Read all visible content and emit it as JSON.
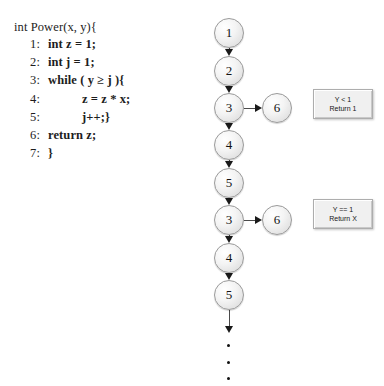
{
  "code": {
    "header": "int Power(x, y){",
    "lines": [
      {
        "num": "1:",
        "text": "int z = 1;",
        "indent": 1
      },
      {
        "num": "2:",
        "text": "int j = 1;",
        "indent": 1
      },
      {
        "num": "3:",
        "text": "while ( y ≥ j ){",
        "indent": 1
      },
      {
        "num": "4:",
        "text": "z = z * x;",
        "indent": 2
      },
      {
        "num": "5:",
        "text": "j++;}",
        "indent": 2
      },
      {
        "num": "6:",
        "text": "return z;",
        "indent": 1
      },
      {
        "num": "7:",
        "text": "}",
        "indent": 1
      }
    ]
  },
  "graph": {
    "main_nodes": [
      {
        "label": "1",
        "x": 214,
        "y": 18
      },
      {
        "label": "2",
        "x": 214,
        "y": 56
      },
      {
        "label": "3",
        "x": 214,
        "y": 93
      },
      {
        "label": "4",
        "x": 214,
        "y": 130
      },
      {
        "label": "5",
        "x": 214,
        "y": 168
      },
      {
        "label": "3",
        "x": 214,
        "y": 205
      },
      {
        "label": "4",
        "x": 214,
        "y": 243
      },
      {
        "label": "5",
        "x": 214,
        "y": 280
      }
    ],
    "branch_nodes": [
      {
        "label": "6",
        "x": 262,
        "y": 93
      },
      {
        "label": "6",
        "x": 262,
        "y": 205
      }
    ],
    "ellipsis_dots": [
      {
        "x": 227,
        "y": 344
      },
      {
        "x": 227,
        "y": 361
      },
      {
        "x": 227,
        "y": 377
      }
    ]
  },
  "notes": [
    {
      "x": 313,
      "y": 89,
      "line1": "Y < 1",
      "line2": "Return 1"
    },
    {
      "x": 313,
      "y": 199,
      "line1": "Y == 1",
      "line2": "Return X"
    }
  ]
}
